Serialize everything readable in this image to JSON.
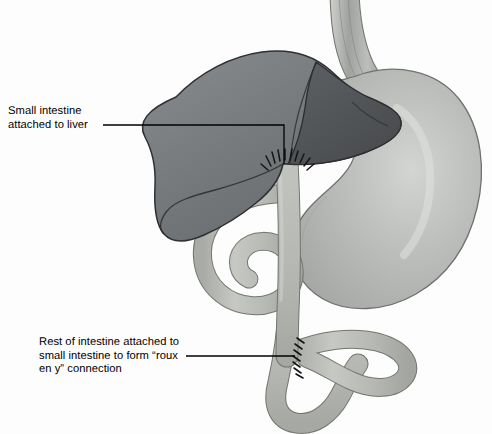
{
  "figure": {
    "width": 492,
    "height": 434,
    "background_color": "#fdfdfd"
  },
  "watermark": {
    "text": "Richard Bowen smale Knoch",
    "note": "faint mirrored bleed-through text at top of page"
  },
  "annotations": [
    {
      "id": "small-intestine-attached-to-liver",
      "lines": [
        "Small intestine",
        "attached to liver"
      ],
      "text": "Small intestine\nattached to liver",
      "leader_color": "#000000"
    },
    {
      "id": "roux-en-y-connection",
      "lines": [
        "Rest of intestine attached to",
        "small intestine to form “roux",
        "en y” connection"
      ],
      "text": "Rest of intestine attached to\nsmall intestine to form “roux\nen y” connection",
      "leader_color": "#000000"
    }
  ],
  "anatomy": [
    {
      "name": "liver",
      "color": "#75787b",
      "outline": "#2b2d2f"
    },
    {
      "name": "liver-right-lobe",
      "color": "#54575a",
      "outline": "#2b2d2f"
    },
    {
      "name": "stomach",
      "color": "#b4b7b4",
      "outline": "#6d7070"
    },
    {
      "name": "esophagus",
      "color": "#b9bcb9",
      "outline": "#6d7070"
    },
    {
      "name": "small-intestine",
      "color": "#bcbeba",
      "outline": "#73756f"
    },
    {
      "name": "roux-limb",
      "color": "#b7b9b5",
      "outline": "#73756f"
    },
    {
      "name": "suture-line-liver-anastomosis",
      "color": "#1a1a1a"
    },
    {
      "name": "suture-line-roux-anastomosis",
      "color": "#1a1a1a"
    }
  ],
  "colors": {
    "liver": "#75787b",
    "liver_dark": "#54575a",
    "stomach": "#b4b7b4",
    "intestine": "#bcbeba",
    "outline": "#6d7070",
    "label_text": "#000000",
    "background": "#fdfdfd"
  }
}
